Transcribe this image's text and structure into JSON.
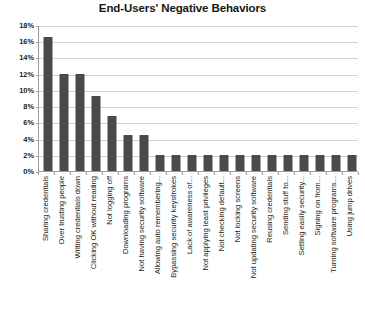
{
  "chart_data": {
    "type": "bar",
    "title": "End-Users' Negative Behaviors",
    "xlabel": "",
    "ylabel": "",
    "ylim": [
      0,
      18
    ],
    "ytick_step": 2,
    "ytick_labels": [
      "0%",
      "2%",
      "4%",
      "6%",
      "8%",
      "10%",
      "12%",
      "14%",
      "16%",
      "18%"
    ],
    "ytick_values": [
      0,
      2,
      4,
      6,
      8,
      10,
      12,
      14,
      16,
      18
    ],
    "grid": true,
    "legend": false,
    "legend_position": "none",
    "bar_color": "#4b4b4b",
    "gridline_color": "#d3d3d3",
    "axis_color": "#9a9a9a",
    "background": "#ffffff",
    "categories": [
      "Sharing credentials",
      "Over trusting people",
      "Writing credentials down",
      "Clicking OK without reading",
      "Not logging off",
      "Downloading programs",
      "Not having security software",
      "Allowing auto remembering...",
      "Bypassing security keystrokes",
      "Lack of awareness of...",
      "Not applying least privileges",
      "Not checking default...",
      "Not locking screens",
      "Not updating security software",
      "Reusing credentials",
      "Sending stuff to...",
      "Setting easily security...",
      "Signing on from...",
      "Turning software programs...",
      "Using jump drives"
    ],
    "values": [
      16.5,
      12,
      12,
      9.3,
      6.8,
      4.5,
      4.5,
      2,
      2,
      2,
      2,
      2,
      2,
      2,
      2,
      2,
      2,
      2,
      2,
      2
    ]
  }
}
